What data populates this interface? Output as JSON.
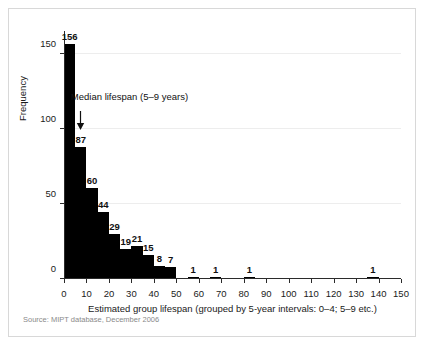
{
  "figure": {
    "source_note": "Source: MIPT database, December 2006",
    "annotation": {
      "text": "Median lifespan (5–9 years)",
      "arrow_icon": "down-arrow-icon",
      "target_bin_start": 5
    },
    "colors": {
      "bar": "#000000",
      "axis": "#2b2b2b",
      "grid": "#ededed",
      "panel_border": "#d8d8d8",
      "text": "#1a1a1a",
      "source_text": "#8a8a8a",
      "background": "#ffffff"
    }
  },
  "chart_data": {
    "type": "bar",
    "title": "",
    "xlabel": "Estimated group lifespan (grouped by 5-year intervals: 0–4; 5–9 etc.)",
    "ylabel": "Frequency",
    "xlim": [
      0,
      150
    ],
    "ylim": [
      0,
      165
    ],
    "xticks": [
      0,
      10,
      20,
      30,
      40,
      50,
      60,
      70,
      80,
      90,
      100,
      110,
      120,
      130,
      140,
      150
    ],
    "yticks": [
      0,
      50,
      100,
      150
    ],
    "grid": true,
    "legend": "none",
    "bin_width": 5,
    "categories": [
      "0–4",
      "5–9",
      "10–14",
      "15–19",
      "20–24",
      "25–29",
      "30–34",
      "35–39",
      "40–44",
      "45–49",
      "55–59",
      "65–69",
      "80–84",
      "135–139"
    ],
    "bin_starts": [
      0,
      5,
      10,
      15,
      20,
      25,
      30,
      35,
      40,
      45,
      55,
      65,
      80,
      135
    ],
    "values": [
      156,
      87,
      60,
      44,
      29,
      19,
      21,
      15,
      8,
      7,
      1,
      1,
      1,
      1
    ],
    "bars": [
      {
        "bin": "0–4",
        "start": 0,
        "value": 156
      },
      {
        "bin": "5–9",
        "start": 5,
        "value": 87
      },
      {
        "bin": "10–14",
        "start": 10,
        "value": 60
      },
      {
        "bin": "15–19",
        "start": 15,
        "value": 44
      },
      {
        "bin": "20–24",
        "start": 20,
        "value": 29
      },
      {
        "bin": "25–29",
        "start": 25,
        "value": 19
      },
      {
        "bin": "30–34",
        "start": 30,
        "value": 21
      },
      {
        "bin": "35–39",
        "start": 35,
        "value": 15
      },
      {
        "bin": "40–44",
        "start": 40,
        "value": 8
      },
      {
        "bin": "45–49",
        "start": 45,
        "value": 7
      },
      {
        "bin": "55–59",
        "start": 55,
        "value": 1
      },
      {
        "bin": "65–69",
        "start": 65,
        "value": 1
      },
      {
        "bin": "80–84",
        "start": 80,
        "value": 1
      },
      {
        "bin": "135–139",
        "start": 135,
        "value": 1
      }
    ]
  }
}
